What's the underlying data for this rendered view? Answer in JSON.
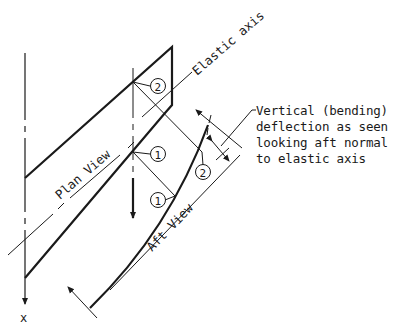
{
  "diagram": {
    "type": "engineering-sketch",
    "labels": {
      "elastic_axis": "Elastic axis",
      "plan_view": "Plan View",
      "aft_view": "Aft View",
      "axis_x": "x",
      "station_1": "1",
      "station_2": "2"
    },
    "note": {
      "lines": [
        "Vertical (bending)",
        "deflection as seen",
        "looking aft normal",
        "to elastic axis"
      ]
    },
    "colors": {
      "ink": "#1a1a1a",
      "background": "#ffffff"
    }
  }
}
